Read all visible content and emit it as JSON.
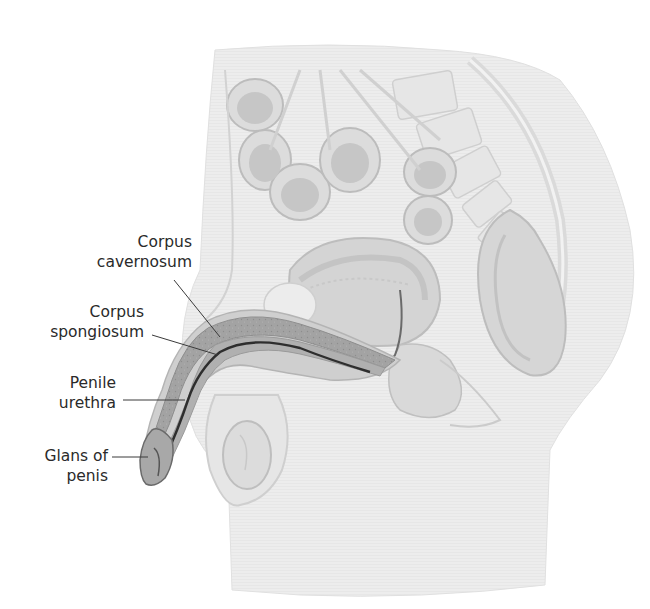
{
  "figure": {
    "labels": [
      {
        "id": "corpus-cavernosum",
        "line1": "Corpus",
        "line2": "cavernosum"
      },
      {
        "id": "corpus-spongiosum",
        "line1": "Corpus",
        "line2": "spongiosum"
      },
      {
        "id": "penile-urethra",
        "line1": "Penile",
        "line2": "urethra"
      },
      {
        "id": "glans-of-penis",
        "line1": "Glans of",
        "line2": "penis"
      }
    ]
  },
  "colors": {
    "background": "#ffffff",
    "label_text": "#2a2a2a",
    "leader_line": "#3a3a3a",
    "tissue_light": "#e4e4e4",
    "tissue_mid": "#c8c8c8",
    "tissue_dark": "#8a8a8a",
    "erectile_tissue": "#9a9a9a",
    "urethra": "#2e2e2e"
  }
}
